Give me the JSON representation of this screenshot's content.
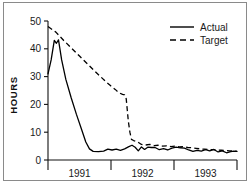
{
  "chart_data": {
    "type": "line",
    "title": "",
    "xlabel": "",
    "ylabel": "HOURS",
    "ylim": [
      0,
      50
    ],
    "yticks": [
      0,
      10,
      20,
      30,
      40,
      50
    ],
    "ytick_labels": [
      "0",
      "10",
      "20",
      "30",
      "40",
      "50"
    ],
    "xlim": [
      0,
      36
    ],
    "xtick_positions": [
      0,
      12,
      24,
      36
    ],
    "xtick_labels": [],
    "x_category_labels": [
      "1991",
      "1992",
      "1993"
    ],
    "grid": false,
    "legend_position": "top-right",
    "legend": [
      {
        "name": "Actual",
        "style": "solid"
      },
      {
        "name": "Target",
        "style": "dashed"
      }
    ],
    "series": [
      {
        "name": "Actual",
        "style": "solid",
        "points": [
          [
            0.0,
            31.0
          ],
          [
            0.6,
            36.0
          ],
          [
            1.2,
            43.0
          ],
          [
            1.6,
            42.0
          ],
          [
            2.0,
            43.2
          ],
          [
            2.6,
            36.0
          ],
          [
            3.4,
            29.0
          ],
          [
            4.4,
            22.5
          ],
          [
            5.4,
            16.5
          ],
          [
            6.4,
            11.0
          ],
          [
            7.2,
            6.5
          ],
          [
            7.9,
            4.0
          ],
          [
            8.6,
            3.1
          ],
          [
            9.6,
            3.0
          ],
          [
            10.6,
            3.2
          ],
          [
            11.4,
            3.9
          ],
          [
            12.2,
            3.6
          ],
          [
            13.0,
            3.9
          ],
          [
            13.8,
            3.5
          ],
          [
            14.6,
            4.0
          ],
          [
            15.4,
            4.8
          ],
          [
            16.0,
            5.3
          ],
          [
            16.6,
            4.6
          ],
          [
            17.2,
            3.3
          ],
          [
            17.8,
            4.7
          ],
          [
            18.4,
            3.8
          ],
          [
            19.0,
            4.6
          ],
          [
            19.7,
            4.5
          ],
          [
            20.4,
            4.5
          ],
          [
            21.2,
            3.7
          ],
          [
            22.0,
            4.1
          ],
          [
            22.8,
            3.6
          ],
          [
            23.6,
            4.3
          ],
          [
            24.4,
            4.6
          ],
          [
            25.2,
            4.4
          ],
          [
            26.0,
            4.3
          ],
          [
            26.8,
            3.6
          ],
          [
            27.6,
            3.1
          ],
          [
            28.4,
            3.5
          ],
          [
            29.2,
            3.2
          ],
          [
            30.0,
            3.7
          ],
          [
            30.8,
            3.3
          ],
          [
            31.6,
            3.8
          ],
          [
            32.4,
            2.9
          ],
          [
            33.2,
            3.3
          ],
          [
            34.0,
            2.6
          ],
          [
            34.8,
            3.0
          ],
          [
            35.4,
            3.2
          ],
          [
            36.0,
            3.1
          ]
        ]
      },
      {
        "name": "Target",
        "style": "dashed",
        "points": [
          [
            0.0,
            48.0
          ],
          [
            1.5,
            46.0
          ],
          [
            3.0,
            43.0
          ],
          [
            4.5,
            40.2
          ],
          [
            6.0,
            37.4
          ],
          [
            7.5,
            34.6
          ],
          [
            9.0,
            31.8
          ],
          [
            10.0,
            30.0
          ],
          [
            11.0,
            28.2
          ],
          [
            12.0,
            26.6
          ],
          [
            12.8,
            25.4
          ],
          [
            13.5,
            24.2
          ],
          [
            14.2,
            23.6
          ],
          [
            14.6,
            23.4
          ],
          [
            14.9,
            22.0
          ],
          [
            15.1,
            18.0
          ],
          [
            15.3,
            14.0
          ],
          [
            15.6,
            10.0
          ],
          [
            15.9,
            7.4
          ],
          [
            16.3,
            7.0
          ],
          [
            17.0,
            6.6
          ],
          [
            17.8,
            5.6
          ],
          [
            18.6,
            5.4
          ],
          [
            19.4,
            5.6
          ],
          [
            20.2,
            5.2
          ],
          [
            21.0,
            5.3
          ],
          [
            21.8,
            5.0
          ],
          [
            22.6,
            5.1
          ],
          [
            23.4,
            4.8
          ],
          [
            24.2,
            5.0
          ],
          [
            25.0,
            4.7
          ],
          [
            25.8,
            4.8
          ],
          [
            26.6,
            4.5
          ],
          [
            27.4,
            4.4
          ],
          [
            28.2,
            4.2
          ],
          [
            29.0,
            4.0
          ],
          [
            29.8,
            3.9
          ],
          [
            30.6,
            3.8
          ],
          [
            31.4,
            3.7
          ],
          [
            32.2,
            3.6
          ],
          [
            33.0,
            3.5
          ],
          [
            33.8,
            3.4
          ],
          [
            34.6,
            3.3
          ],
          [
            35.4,
            3.2
          ],
          [
            36.0,
            3.1
          ]
        ]
      }
    ]
  }
}
